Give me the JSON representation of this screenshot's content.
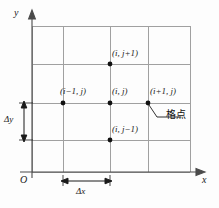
{
  "figure": {
    "type": "grid-stencil-diagram",
    "background_color": "#fdfdfd",
    "line_color": "#9a9a9a",
    "axis_color": "#4a4a4a",
    "point_color": "#111111"
  },
  "axes": {
    "x_label": "x",
    "y_label": "y",
    "origin_label": "O"
  },
  "spacings": {
    "dx_label": "Δx",
    "dy_label": "Δy"
  },
  "nodes": [
    {
      "id": "center",
      "label": "(i, j)",
      "cx": 110,
      "cy": 103
    },
    {
      "id": "west",
      "label": "(i−1, j)",
      "cx": 63,
      "cy": 103
    },
    {
      "id": "east",
      "label": "(i+1, j)",
      "cx": 148,
      "cy": 103
    },
    {
      "id": "north",
      "label": "(i, j+1)",
      "cx": 110,
      "cy": 64
    },
    {
      "id": "south",
      "label": "(i, j−1)",
      "cx": 110,
      "cy": 140
    }
  ],
  "annotation": {
    "text": "格点"
  },
  "grid": {
    "x_lines": [
      32,
      63,
      110,
      148,
      190
    ],
    "y_lines": [
      26,
      64,
      103,
      140,
      172
    ]
  }
}
